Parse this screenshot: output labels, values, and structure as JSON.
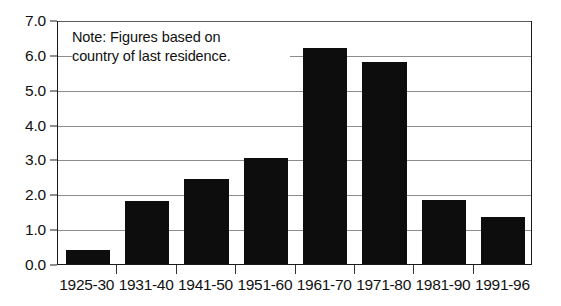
{
  "chart_data": {
    "type": "bar",
    "title": "",
    "subtitle": "",
    "xlabel": "",
    "ylabel": "",
    "categories": [
      "1925-30",
      "1931-40",
      "1941-50",
      "1951-60",
      "1961-70",
      "1971-80",
      "1981-90",
      "1991-96"
    ],
    "values": [
      0.4,
      1.8,
      2.45,
      3.05,
      6.2,
      5.8,
      1.85,
      1.35
    ],
    "ylim": [
      0.0,
      7.0
    ],
    "ytick_step": 1.0,
    "ytick_labels": [
      "0.0",
      "1.0",
      "2.0",
      "3.0",
      "4.0",
      "5.0",
      "6.0",
      "7.0"
    ],
    "grid": true,
    "grid_axis": "y",
    "legend": "none",
    "bar_color": "#0d0d0d",
    "gridline_color": "#8d8d8d",
    "axis_color": "#1a1a1a",
    "annotations": [
      {
        "name": "note",
        "lines": [
          "Note: Figures based on",
          "country of last residence."
        ]
      }
    ]
  },
  "note": {
    "line1": "Note: Figures based on",
    "line2": "country of last residence."
  }
}
